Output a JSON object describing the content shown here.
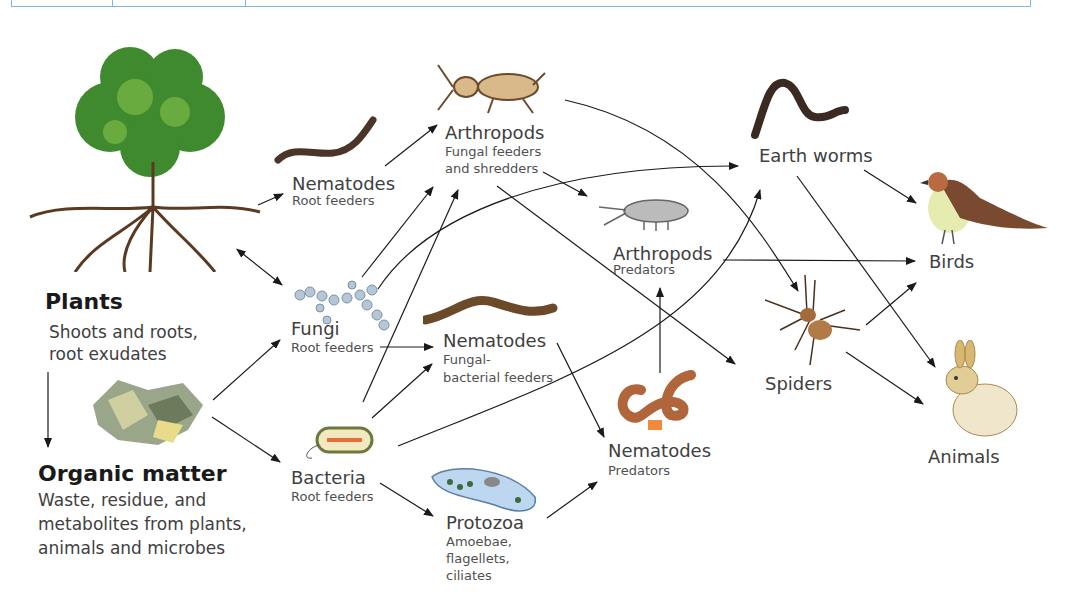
{
  "nodes": {
    "plants": {
      "title": "Plants",
      "desc": [
        "Shoots and roots,",
        "root exudates"
      ]
    },
    "organic": {
      "title": "Organic matter",
      "desc": [
        "Waste, residue, and",
        "metabolites from plants,",
        "animals and microbes"
      ]
    },
    "nem_root": {
      "title": "Nematodes",
      "sub": "Root feeders"
    },
    "fungi": {
      "title": "Fungi",
      "sub": "Root feeders"
    },
    "bacteria": {
      "title": "Bacteria",
      "sub": "Root feeders"
    },
    "arth_fungal": {
      "title": "Arthropods",
      "sub": [
        "Fungal feeders",
        "and shredders"
      ]
    },
    "nem_fungal": {
      "title": "Nematodes",
      "sub": [
        "Fungal-",
        "bacterial feeders"
      ]
    },
    "protozoa": {
      "title": "Protozoa",
      "sub": [
        "Amoebae,",
        "flagellets,",
        "ciliates"
      ]
    },
    "arth_pred": {
      "title": "Arthropods",
      "sub": "Predators"
    },
    "nem_pred": {
      "title": "Nematodes",
      "sub": "Predators"
    },
    "earthworms": {
      "title": "Earth worms"
    },
    "spiders": {
      "title": "Spiders"
    },
    "birds": {
      "title": "Birds"
    },
    "animals": {
      "title": "Animals"
    }
  },
  "edges": [
    [
      "plants",
      "nem_root"
    ],
    [
      "plants",
      "fungi"
    ],
    [
      "fungi",
      "plants"
    ],
    [
      "plants",
      "organic"
    ],
    [
      "organic",
      "fungi"
    ],
    [
      "organic",
      "bacteria"
    ],
    [
      "nem_root",
      "arth_fungal"
    ],
    [
      "fungi",
      "arth_fungal"
    ],
    [
      "fungi",
      "earthworms"
    ],
    [
      "fungi",
      "nem_fungal"
    ],
    [
      "bacteria",
      "arth_fungal"
    ],
    [
      "bacteria",
      "nem_fungal"
    ],
    [
      "bacteria",
      "earthworms"
    ],
    [
      "bacteria",
      "protozoa"
    ],
    [
      "arth_fungal",
      "arth_pred"
    ],
    [
      "arth_fungal",
      "spiders"
    ],
    [
      "arth_fungal",
      "spiders_curve"
    ],
    [
      "nem_fungal",
      "nem_pred"
    ],
    [
      "protozoa",
      "nem_pred"
    ],
    [
      "nem_pred",
      "arth_pred"
    ],
    [
      "arth_pred",
      "birds"
    ],
    [
      "earthworms",
      "birds"
    ],
    [
      "earthworms",
      "animals"
    ],
    [
      "spiders",
      "birds"
    ],
    [
      "spiders",
      "animals"
    ]
  ],
  "colors": {
    "line": "#1a1a1a",
    "frame": "#7cb6e6"
  }
}
